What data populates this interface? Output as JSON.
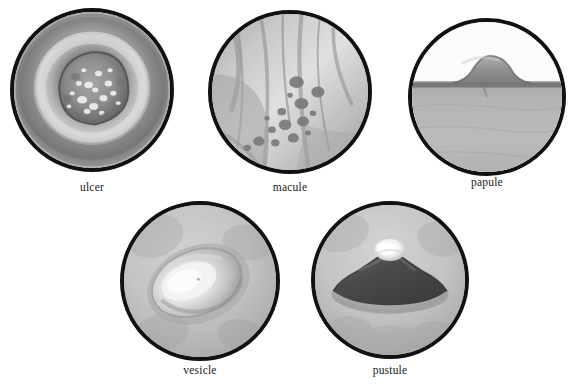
{
  "figure": {
    "kind": "medical-illustration-plate",
    "background_color": "#ffffff",
    "border_color": "#111111",
    "label_color": "#1a1a1a"
  },
  "specimens": [
    {
      "id": "ulcer",
      "label": "ulcer",
      "row": 1,
      "left": 10,
      "top": 8,
      "size": 164,
      "label_top": 181,
      "appearance": "crater-like depression with raised rolled rim and granular light speckled base",
      "tones": {
        "rim_light": "#cfcfcf",
        "ring_dark": "#7a7a7a",
        "crater": "#8f8f8f",
        "speckle": "#f2f2f2"
      }
    },
    {
      "id": "macule",
      "label": "macule",
      "row": 1,
      "left": 208,
      "top": 10,
      "size": 164,
      "label_top": 181,
      "appearance": "flat skin with diagonal folds and scattered flat dark round spots",
      "tones": {
        "skin_light": "#d8d8d8",
        "fold": "#9a9a9a",
        "spot": "#7b7b7b"
      }
    },
    {
      "id": "papule",
      "label": "papule",
      "row": 1,
      "left": 408,
      "top": 18,
      "size": 158,
      "label_top": 176,
      "appearance": "cross-section profile of skin with small solid raised bump above the surface",
      "tones": {
        "sky": "#fbfbfb",
        "skin": "#b5b5b5",
        "bump": "#8e8e8e",
        "surface_line": "#6f6f6f"
      }
    },
    {
      "id": "vesicle",
      "label": "vesicle",
      "row": 2,
      "left": 120,
      "top": 201,
      "size": 160,
      "label_top": 364,
      "appearance": "light skin with oval translucent fluid-filled blister and bright highlight",
      "tones": {
        "skin": "#c3c3c3",
        "blister": "#efefef",
        "shadow": "#8f8f8f"
      }
    },
    {
      "id": "pustule",
      "label": "pustule",
      "row": 2,
      "left": 311,
      "top": 201,
      "size": 158,
      "label_top": 364,
      "appearance": "light skin with dark raised dome lesion capped by a bright white pus-filled tip",
      "tones": {
        "skin": "#c6c6c6",
        "dome": "#4e4e4e",
        "pus_tip": "#fdfdfd",
        "shadow": "#8a8a8a"
      }
    }
  ]
}
